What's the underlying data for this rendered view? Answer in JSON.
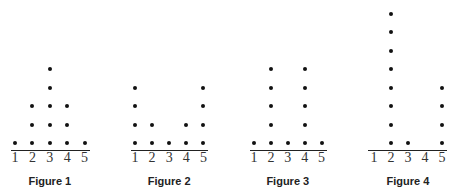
{
  "chart_data": [
    {
      "type": "dot",
      "title": "Figure 1",
      "categories": [
        "1",
        "2",
        "3",
        "4",
        "5"
      ],
      "values": [
        1,
        3,
        5,
        3,
        1
      ]
    },
    {
      "type": "dot",
      "title": "Figure 2",
      "categories": [
        "1",
        "2",
        "3",
        "4",
        "5"
      ],
      "values": [
        4,
        2,
        1,
        2,
        4
      ]
    },
    {
      "type": "dot",
      "title": "Figure 3",
      "categories": [
        "1",
        "2",
        "3",
        "4",
        "5"
      ],
      "values": [
        1,
        5,
        1,
        5,
        1
      ]
    },
    {
      "type": "dot",
      "title": "Figure 4",
      "categories": [
        "1",
        "2",
        "3",
        "4",
        "5"
      ],
      "values": [
        0,
        8,
        1,
        0,
        4
      ]
    }
  ],
  "colors": {
    "dot": "#111111",
    "axis": "#222222",
    "text": "#333333"
  }
}
